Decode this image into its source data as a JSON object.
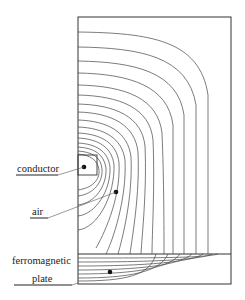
{
  "diagram": {
    "title": "",
    "labels": {
      "conductor": "conductor",
      "air": "air",
      "plate_line1": "ferromagnetic",
      "plate_line2": "plate"
    },
    "colors": {
      "line": "#333333",
      "background": "#ffffff"
    },
    "regions": [
      "conductor",
      "air",
      "ferromagnetic plate"
    ]
  }
}
